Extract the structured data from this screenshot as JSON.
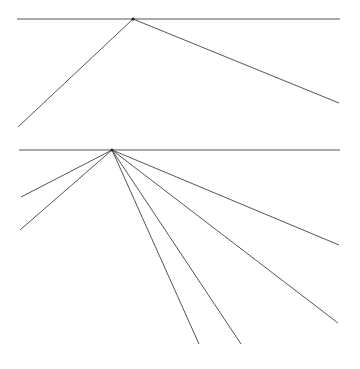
{
  "figures": [
    {
      "name": "figure-1",
      "baseline": {
        "x1": 17,
        "y1": 19,
        "x2": 340,
        "y2": 19
      },
      "vertex": {
        "x": 133,
        "y": 19
      },
      "rays": [
        {
          "x": 18,
          "y": 127
        },
        {
          "x": 339,
          "y": 103
        }
      ]
    },
    {
      "name": "figure-2",
      "baseline": {
        "x1": 19,
        "y1": 150,
        "x2": 340,
        "y2": 150
      },
      "vertex": {
        "x": 112,
        "y": 150
      },
      "rays": [
        {
          "x": 21,
          "y": 197
        },
        {
          "x": 20,
          "y": 230
        },
        {
          "x": 199,
          "y": 344
        },
        {
          "x": 241,
          "y": 344
        },
        {
          "x": 338,
          "y": 323
        },
        {
          "x": 339,
          "y": 245
        }
      ]
    }
  ],
  "colors": {
    "line": "#555555",
    "vertex": "#222222",
    "background": "#ffffff"
  }
}
